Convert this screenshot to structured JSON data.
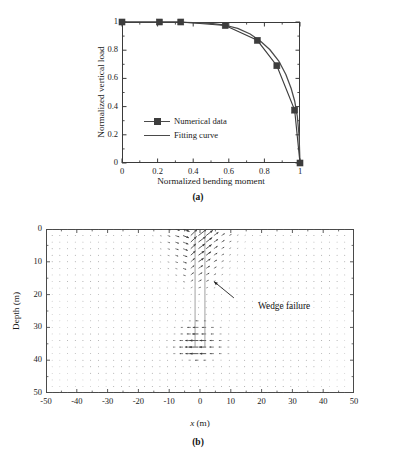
{
  "figure": {
    "panels": [
      {
        "id": "a",
        "caption": "(a)"
      },
      {
        "id": "b",
        "caption": "(b)"
      }
    ]
  },
  "panel_a": {
    "caption": "(a)",
    "xlabel": "Normalized bending moment",
    "ylabel": "Normalized vertical load",
    "xticks": [
      "0",
      "0.2",
      "0.4",
      "0.6",
      "0.8",
      "1"
    ],
    "yticks": [
      "0",
      "0.2",
      "0.4",
      "0.6",
      "0.8",
      "1"
    ],
    "legend": [
      {
        "label": "Numerical data",
        "marker": "square",
        "style": "line-marker"
      },
      {
        "label": "Fitting curve",
        "marker": "none",
        "style": "line"
      }
    ]
  },
  "panel_b": {
    "caption": "(b)",
    "xlabel": "x (m)",
    "xlabel_italic_part": "x",
    "xlabel_unit_part": " (m)",
    "ylabel": "Depth (m)",
    "xticks": [
      "-50",
      "-40",
      "-30",
      "-20",
      "-10",
      "0",
      "10",
      "20",
      "30",
      "40",
      "50"
    ],
    "yticks": [
      "0",
      "10",
      "20",
      "30",
      "40",
      "50"
    ],
    "annotation": "Wedge failure"
  },
  "chart_data": [
    {
      "type": "line",
      "title": "",
      "xlabel": "Normalized bending moment",
      "ylabel": "Normalized vertical load",
      "xlim": [
        0,
        1
      ],
      "ylim": [
        0,
        1
      ],
      "xticks": [
        0,
        0.2,
        0.4,
        0.6,
        0.8,
        1
      ],
      "yticks": [
        0,
        0.2,
        0.4,
        0.6,
        0.8,
        1
      ],
      "grid": false,
      "legend_position": "lower-left-inside",
      "series": [
        {
          "name": "Numerical data",
          "marker": "square",
          "color": "#3d3d3d",
          "x": [
            0,
            0.21,
            0.33,
            0.58,
            0.76,
            0.87,
            0.97,
            1.0
          ],
          "y": [
            1.0,
            1.0,
            1.0,
            0.975,
            0.87,
            0.69,
            0.375,
            0.0
          ]
        },
        {
          "name": "Fitting curve",
          "marker": "none",
          "color": "#4a4a4a",
          "x": [
            0,
            0.1,
            0.2,
            0.3,
            0.4,
            0.5,
            0.58,
            0.65,
            0.72,
            0.78,
            0.83,
            0.88,
            0.92,
            0.95,
            0.97,
            0.985,
            0.995,
            1.0
          ],
          "y": [
            1.0,
            1.0,
            1.0,
            0.999,
            0.996,
            0.99,
            0.977,
            0.955,
            0.915,
            0.862,
            0.805,
            0.725,
            0.63,
            0.53,
            0.44,
            0.33,
            0.19,
            0.0
          ]
        }
      ]
    },
    {
      "type": "scatter",
      "subtype": "quiver",
      "title": "",
      "xlabel": "x (m)",
      "ylabel": "Depth (m)",
      "xlim": [
        -50,
        50
      ],
      "ylim": [
        50,
        0
      ],
      "y_axis_inverted": true,
      "xticks": [
        -50,
        -40,
        -30,
        -20,
        -10,
        0,
        10,
        20,
        30,
        40,
        50
      ],
      "yticks": [
        0,
        10,
        20,
        30,
        40,
        50
      ],
      "grid": false,
      "annotations": [
        {
          "text": "Wedge failure",
          "x": 12,
          "y": 21,
          "arrow_to_x": 4.5,
          "arrow_to_y": 16
        }
      ],
      "description": "Soil displacement vector field around a laterally loaded monopile; pile axis at x = 0 m embedded to about 36 m depth. Large vectors form a passive wedge from surface to about 20 m on the loaded side and a flow-around zone below.",
      "field_grid": {
        "x_step": 2.5,
        "y_step": 2.0,
        "x_from": -48,
        "x_to": 48,
        "y_from": 0,
        "y_to": 50
      },
      "pile": {
        "x": 0,
        "half_width": 1.6,
        "top_depth": 0,
        "tip_depth": 36
      }
    }
  ]
}
